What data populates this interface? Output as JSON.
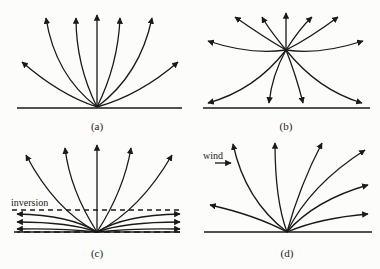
{
  "panels": [
    {
      "id": "a",
      "label": "(a)",
      "description": "Rays curving upward from a ground source"
    },
    {
      "id": "b",
      "label": "(b)",
      "description": "Elevated source; rays curving both up and down to the ground"
    },
    {
      "id": "c",
      "label": "(c)",
      "description": "Ground source with temperature inversion trapping low rays",
      "annotation": "inversion"
    },
    {
      "id": "d",
      "label": "(d)",
      "description": "Ground source with wind bending rays downwind",
      "annotation": "wind"
    }
  ],
  "colors": {
    "ink": "#1a1a1a",
    "background": "#fcfcfa"
  }
}
